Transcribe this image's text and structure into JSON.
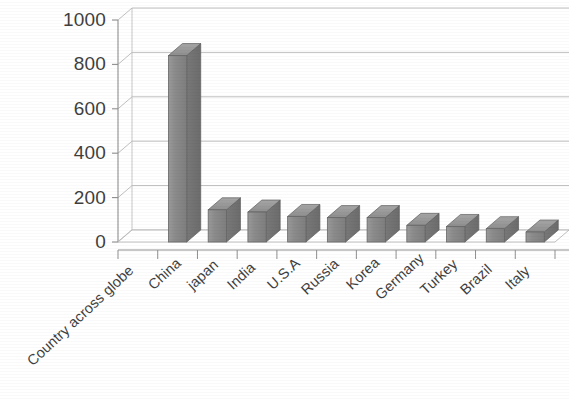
{
  "chart_data": {
    "type": "bar",
    "title": "",
    "subtitle": "",
    "xlabel": "Country across globe",
    "ylabel": "",
    "categories": [
      "Country across globe",
      "China",
      "japan",
      "India",
      "U.S.A",
      "Russia",
      "Korea",
      "Germany",
      "Turkey",
      "Brazil",
      "Italy"
    ],
    "values": [
      0,
      840,
      145,
      135,
      115,
      110,
      110,
      75,
      70,
      60,
      45
    ],
    "series": [
      {
        "name": "",
        "values": [
          0,
          840,
          145,
          135,
          115,
          110,
          110,
          75,
          70,
          60,
          45
        ]
      }
    ],
    "ylim": [
      0,
      1000
    ],
    "ytick_labels": [
      "0",
      "200",
      "400",
      "600",
      "800",
      "1000"
    ],
    "ytick_values": [
      0,
      200,
      400,
      600,
      800,
      1000
    ],
    "ystep": 200,
    "grid": true,
    "grid_axis": "y",
    "legend": false,
    "legend_position": "none",
    "three_d": true,
    "bar_color": "#8c8c8c",
    "bar_edge_color": "#6e6e6e",
    "grid_color": "#b9b9b9",
    "axis_color": "#8f8f8f",
    "background_color": "#ffffff",
    "text_color": "#3f3f3f",
    "annotations": []
  },
  "axes": {
    "y_ticks": [
      {
        "label": "1000",
        "value": 1000
      },
      {
        "label": "800",
        "value": 800
      },
      {
        "label": "600",
        "value": 600
      },
      {
        "label": "400",
        "value": 400
      },
      {
        "label": "200",
        "value": 200
      },
      {
        "label": "0",
        "value": 0
      }
    ],
    "x_categories": [
      {
        "label": "Country across globe",
        "value": 0
      },
      {
        "label": "China",
        "value": 840
      },
      {
        "label": "japan",
        "value": 145
      },
      {
        "label": "India",
        "value": 135
      },
      {
        "label": "U.S.A",
        "value": 115
      },
      {
        "label": "Russia",
        "value": 110
      },
      {
        "label": "Korea",
        "value": 110
      },
      {
        "label": "Germany",
        "value": 75
      },
      {
        "label": "Turkey",
        "value": 70
      },
      {
        "label": "Brazil",
        "value": 60
      },
      {
        "label": "Italy",
        "value": 45
      }
    ]
  }
}
